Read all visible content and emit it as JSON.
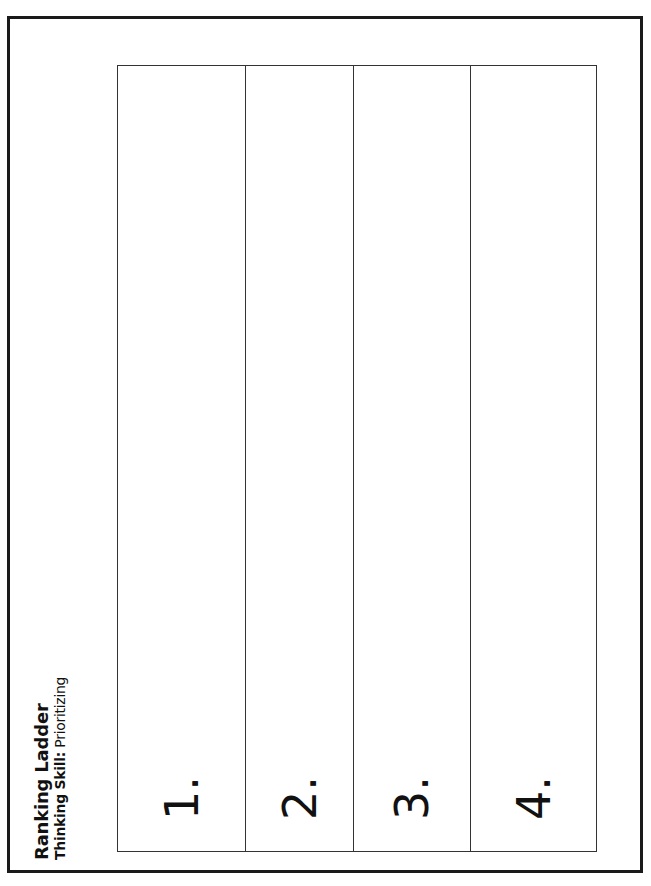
{
  "worksheet": {
    "title": "Ranking Ladder",
    "subtitle_label": "Thinking Skill:",
    "subtitle_value": "Prioritizing",
    "orientation": "rotated 90deg counterclockwise",
    "rungs": [
      {
        "label": "1.",
        "width": 128
      },
      {
        "label": "2.",
        "width": 108
      },
      {
        "label": "3.",
        "width": 117
      },
      {
        "label": "4.",
        "width": 127
      }
    ]
  }
}
